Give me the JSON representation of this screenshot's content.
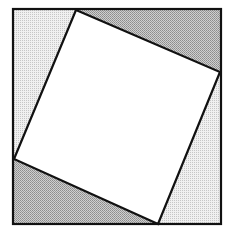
{
  "diagram": {
    "title": "",
    "type": "pythagorean-square-proof",
    "outer_square": {
      "x": 13,
      "y": 9,
      "width": 208,
      "height": 215,
      "stroke": "#111111"
    },
    "inner_square": {
      "points": "76,10 220,72 158,224 14,159",
      "fill": "#ffffff",
      "stroke": "#111111"
    },
    "triangles": [
      {
        "name": "top-right-triangle",
        "points": "76,10 220,10 220,72",
        "shade": "dark"
      },
      {
        "name": "right-bottom-triangle",
        "points": "220,72 220,224 158,224",
        "shade": "light"
      },
      {
        "name": "bottom-left-triangle",
        "points": "158,224 14,224 14,159",
        "shade": "dark"
      },
      {
        "name": "left-top-triangle",
        "points": "14,159 14,10 76,10",
        "shade": "light"
      }
    ],
    "colors": {
      "dark_fill": "#b8b8b8",
      "light_fill": "#e2e2e2",
      "line": "#111111",
      "background": "#ffffff"
    }
  }
}
